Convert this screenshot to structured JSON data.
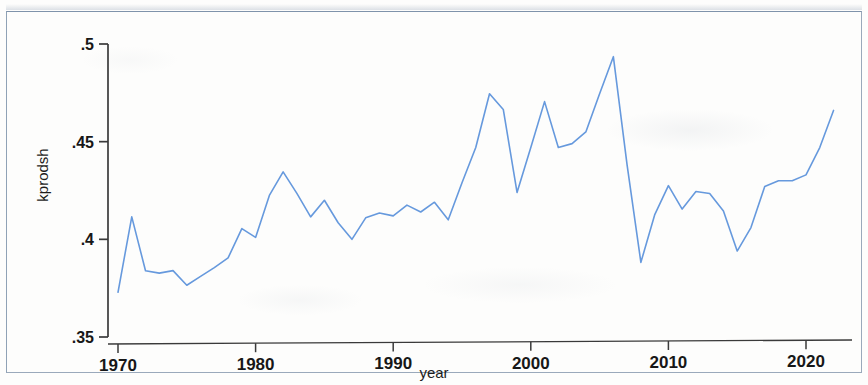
{
  "figure": {
    "kind": "stata-line-plot",
    "background_color": "#fdfdfc",
    "frame_color": "#9aa9bb",
    "axis_color": "#3a3a3a",
    "line_color": "#6699dd"
  },
  "chart_data": {
    "type": "line",
    "title": "",
    "subtitle": "",
    "xlabel": "year",
    "ylabel": "kprodsh",
    "xlim": [
      1970,
      2022
    ],
    "ylim": [
      0.35,
      0.5
    ],
    "xticks": [
      1970,
      1980,
      1990,
      2000,
      2010,
      2020
    ],
    "xtick_labels": [
      "1970",
      "1980",
      "1990",
      "2000",
      "2010",
      "2020"
    ],
    "yticks": [
      0.35,
      0.4,
      0.45,
      0.5
    ],
    "ytick_labels": [
      ".35",
      ".4",
      ".45",
      ".5"
    ],
    "grid": false,
    "legend": false,
    "legend_position": "none",
    "series": [
      {
        "name": "kprodsh",
        "color": "#6699dd",
        "x": [
          1970,
          1971,
          1972,
          1973,
          1974,
          1975,
          1976,
          1977,
          1978,
          1979,
          1980,
          1981,
          1982,
          1983,
          1984,
          1985,
          1986,
          1987,
          1988,
          1989,
          1990,
          1991,
          1992,
          1993,
          1994,
          1995,
          1996,
          1997,
          1998,
          1999,
          2000,
          2001,
          2002,
          2003,
          2004,
          2005,
          2006,
          2007,
          2008,
          2009,
          2010,
          2011,
          2012,
          2013,
          2014,
          2015,
          2016,
          2017,
          2018,
          2019,
          2020,
          2021,
          2022
        ],
        "values": [
          0.3729,
          0.4115,
          0.3839,
          0.3827,
          0.384,
          0.3765,
          0.381,
          0.3855,
          0.3905,
          0.4055,
          0.401,
          0.4225,
          0.4345,
          0.4235,
          0.4115,
          0.42,
          0.4085,
          0.4,
          0.411,
          0.4135,
          0.412,
          0.4175,
          0.414,
          0.419,
          0.41,
          0.429,
          0.447,
          0.4745,
          0.4665,
          0.424,
          0.447,
          0.4705,
          0.447,
          0.449,
          0.455,
          0.4745,
          0.4935,
          0.438,
          0.3882,
          0.4125,
          0.4275,
          0.4155,
          0.4245,
          0.4235,
          0.4145,
          0.394,
          0.406,
          0.427,
          0.43,
          0.43,
          0.433,
          0.447,
          0.466
        ]
      }
    ]
  }
}
